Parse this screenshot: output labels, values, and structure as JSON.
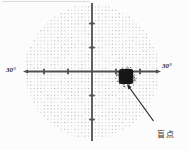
{
  "figure": {
    "kind": "visual-field-perimetry-chart",
    "background": "#fcfcfc",
    "axes": {
      "left_label": "30°",
      "right_label": "30°",
      "color": "#4f4f4f",
      "center_x": 92,
      "center_y": 71.5,
      "radius_px": 68,
      "degrees_radius": 30,
      "tick_spacing_px": 24,
      "ticks_per_side": 2,
      "tick_length": 5.5
    },
    "dot_grid": {
      "spacing": 3.4,
      "dot_size": 1.1,
      "color": "#979797"
    },
    "blind_spot": {
      "label": "盲点",
      "cx": 126,
      "cy": 76.5,
      "core_w": 14.5,
      "core_h": 15,
      "color": "#161616",
      "arrow": {
        "x1": 153.5,
        "y1": 121,
        "x2": 129,
        "y2": 87
      },
      "arrow_color": "#252525"
    }
  }
}
